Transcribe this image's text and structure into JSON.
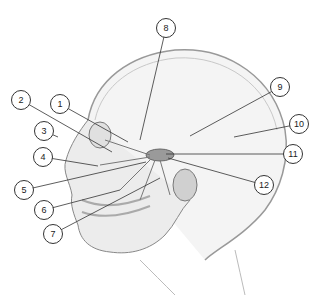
{
  "diagram": {
    "type": "anatomical-illustration",
    "colors": {
      "line": "#333333",
      "shading": "#b9b9b9",
      "ganglion": "#9a9a9a",
      "background": "#ffffff"
    },
    "callouts": [
      {
        "id": 1,
        "label": "1",
        "x": 60,
        "y": 104,
        "target": [
          128,
          142
        ]
      },
      {
        "id": 2,
        "label": "2",
        "x": 21,
        "y": 100,
        "target": [
          112,
          152
        ]
      },
      {
        "id": 3,
        "label": "3",
        "x": 44,
        "y": 131,
        "target": [
          58,
          137
        ]
      },
      {
        "id": 4,
        "label": "4",
        "x": 43,
        "y": 157,
        "target": [
          98,
          166
        ]
      },
      {
        "id": 5,
        "label": "5",
        "x": 24,
        "y": 190,
        "target": [
          146,
          162
        ]
      },
      {
        "id": 6,
        "label": "6",
        "x": 44,
        "y": 210,
        "target": [
          120,
          190
        ]
      },
      {
        "id": 7,
        "label": "7",
        "x": 53,
        "y": 234,
        "target": [
          160,
          178
        ]
      },
      {
        "id": 8,
        "label": "8",
        "x": 166,
        "y": 28,
        "target": [
          140,
          140
        ]
      },
      {
        "id": 9,
        "label": "9",
        "x": 280,
        "y": 87,
        "target": [
          190,
          136
        ]
      },
      {
        "id": 10,
        "label": "10",
        "x": 299,
        "y": 124,
        "target": [
          234,
          137
        ]
      },
      {
        "id": 11,
        "label": "11",
        "x": 293,
        "y": 154,
        "target": [
          166,
          154
        ]
      },
      {
        "id": 12,
        "label": "12",
        "x": 264,
        "y": 185,
        "target": [
          168,
          158
        ]
      }
    ]
  }
}
